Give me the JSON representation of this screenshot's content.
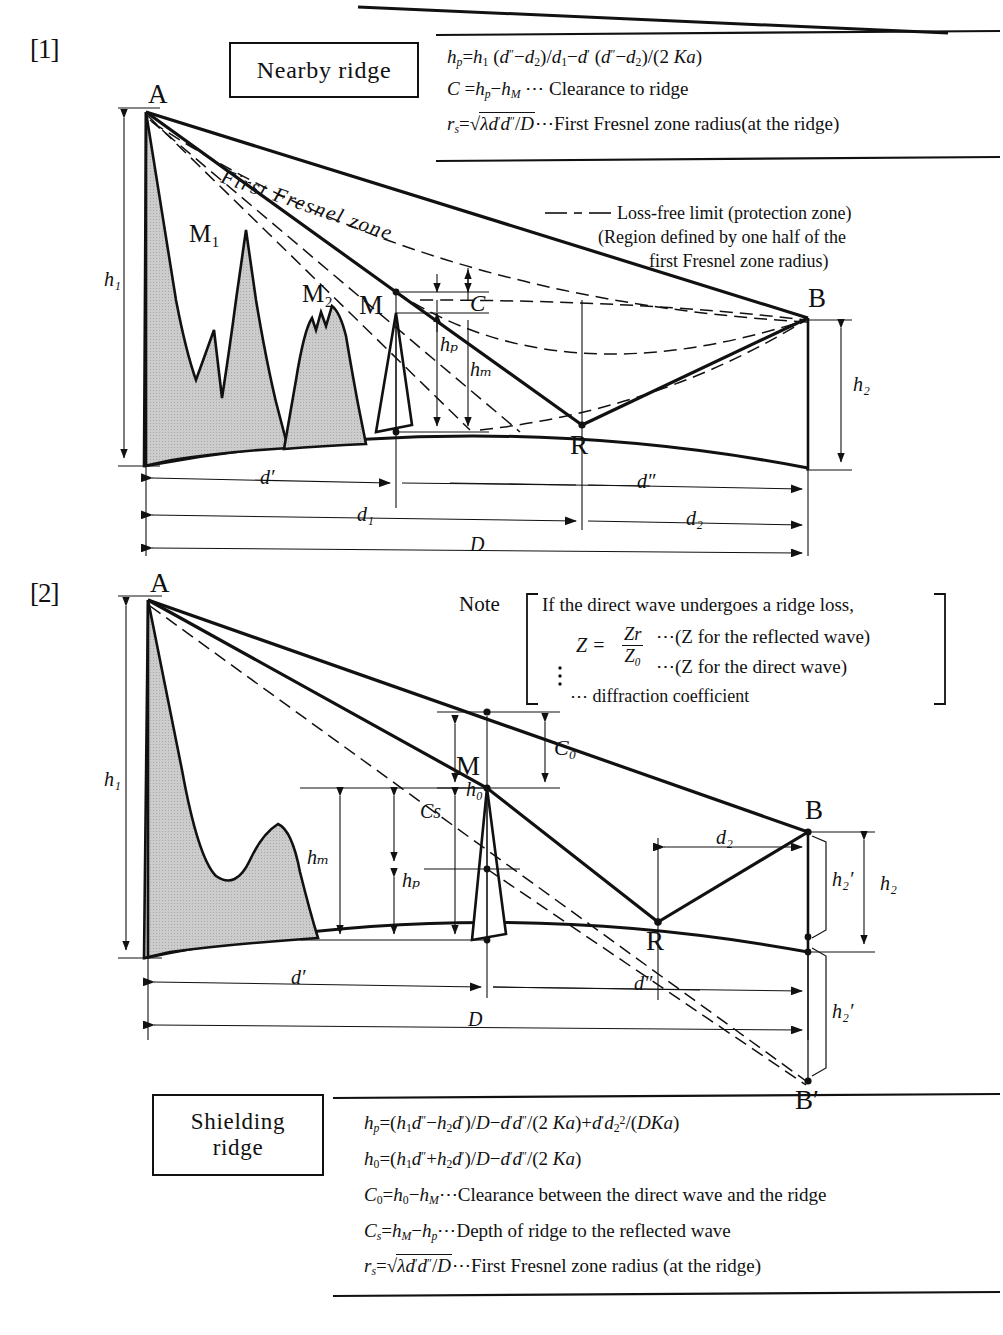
{
  "figure": {
    "title_implicit": "Radio path profile diagrams: nearby ridge and shielding ridge",
    "sections": [
      {
        "number": "[1]",
        "box_label": "Nearby ridge",
        "formulas": [
          "hp = h1 (d″−d2)/d1 − d′ (d″−d2)/(2 Ka)",
          "C = hp − hM ⋯ Clearance to ridge",
          "rs = √(λ d′ d″ / D) ⋯ First Fresnel zone radius (at the ridge)"
        ],
        "legend": {
          "line1": "Loss-free limit (protection zone)",
          "line2": "(Region defined by one half of the",
          "line3": "first Fresnel zone radius)"
        },
        "diagram_labels": {
          "A": "A",
          "B": "B",
          "R": "R",
          "M": "M",
          "M1": "M₁",
          "M2": "M₂",
          "h1": "h₁",
          "h2": "h₂",
          "hp": "hₚ",
          "hM": "hₘ",
          "C": "C",
          "fresnel": "First Fresnel zone",
          "d_prime": "d′",
          "d_dprime": "d″",
          "d1": "d₁",
          "d2": "d₂",
          "D": "D"
        }
      },
      {
        "number": "[2]",
        "box_label_line1": "Shielding",
        "box_label_line2": "ridge",
        "note": {
          "label": "Note",
          "line1": "If the direct wave undergoes a ridge loss,",
          "line2_lhs": "Z =",
          "line2_num": "Zr",
          "line2_den": "Z₀",
          "line2_num_desc": "⋯(Z for the reflected wave)",
          "line2_den_desc": "⋯(Z for the direct wave)",
          "line3": "⋯ diffraction coefficient"
        },
        "formulas": [
          "hp = (h1d″ − h2d′)/D − d′d″/(2 Ka) + d′d₂²/(DKa)",
          "h0 = (h1d″ + h2d′)/D − d′d″/(2 Ka)",
          "C0 = h0 − hM ⋯ Clearance between the direct wave and the ridge",
          "Cs = hM − hp ⋯ Depth of ridge to the reflected wave",
          "rs = √(λd′d″/D) ⋯ First Fresnel zone radius (at the ridge)"
        ],
        "diagram_labels": {
          "A": "A",
          "B": "B",
          "B_prime": "B′",
          "R": "R",
          "M": "M",
          "h1": "h₁",
          "h2": "h₂",
          "h2_prime": "h₂′",
          "h2_prime_lower": "h₂′",
          "hM": "hₘ",
          "hp": "hₚ",
          "h0": "h₀",
          "Cs": "Cs",
          "C0": "C₀",
          "d_prime": "d′",
          "d_dprime": "d″",
          "d2": "d₂",
          "D": "D"
        }
      }
    ],
    "colors": {
      "ink": "#111111",
      "terrain_fill": "#c9c9c9",
      "paper": "#ffffff"
    }
  }
}
